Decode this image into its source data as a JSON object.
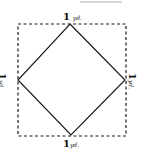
{
  "diagram": {
    "title": "",
    "outer_square": {
      "style": "dashed",
      "side": "1 yd."
    },
    "inner_square": {
      "style": "solid",
      "orientation": "rotated 45 degrees, vertices at midpoints of outer square"
    },
    "labels": {
      "top": {
        "num": "1",
        "unit": "yd."
      },
      "bottom": {
        "num": "1",
        "unit": "yd."
      },
      "left": {
        "num": "1",
        "unit": "yd."
      },
      "right": {
        "num": "1",
        "unit": "yd."
      }
    },
    "colors": {
      "line": "#1a1a1a",
      "background": "#ffffff"
    }
  }
}
